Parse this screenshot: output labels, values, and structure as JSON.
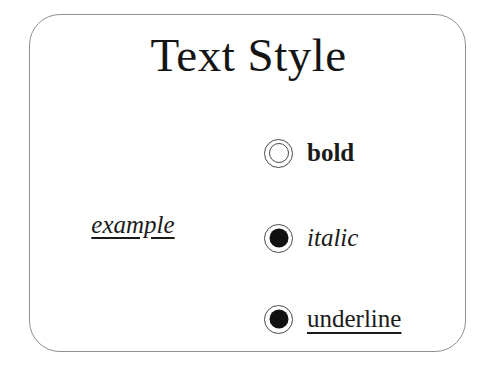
{
  "dialog": {
    "title": "Text Style",
    "border_color": "#8e8e90",
    "background_color": "#ffffff",
    "text_color": "#1a1a1a"
  },
  "preview": {
    "text": "example",
    "bold": false,
    "italic": true,
    "underline": true
  },
  "options": [
    {
      "name": "bold",
      "label": "bold",
      "selected": false,
      "state": "off"
    },
    {
      "name": "italic",
      "label": "italic",
      "selected": true,
      "state": "on"
    },
    {
      "name": "underline",
      "label": "underline",
      "selected": true,
      "state": "on"
    }
  ]
}
